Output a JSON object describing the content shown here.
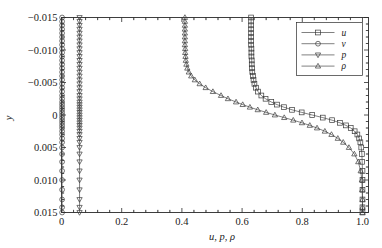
{
  "chart_data": {
    "type": "line",
    "title": "",
    "xlabel": "u, p, ρ",
    "ylabel": "y",
    "xlim": [
      0,
      1.02
    ],
    "ylim": [
      -0.015,
      0.015
    ],
    "y_inverted": true,
    "grid": false,
    "legend_position": "upper-right",
    "xticks": [
      0,
      0.2,
      0.4,
      0.6,
      0.8,
      1.0
    ],
    "xticklabels": [
      "0",
      "0.2",
      "0.4",
      "0.6",
      "0.8",
      "1.0"
    ],
    "yticks": [
      -0.015,
      -0.01,
      -0.005,
      0,
      0.005,
      0.01,
      0.015
    ],
    "yticklabels": [
      "−0.015",
      "−0.010",
      "−0.005",
      "0",
      "0.005",
      "0.010",
      "0.015"
    ],
    "x_minor_tick_count": 4,
    "y_minor_tick_count": 4,
    "series": [
      {
        "name": "u",
        "marker": "square",
        "y": [
          -0.015,
          -0.0144,
          -0.0138,
          -0.0132,
          -0.0126,
          -0.012,
          -0.0114,
          -0.0108,
          -0.0102,
          -0.0096,
          -0.009,
          -0.0084,
          -0.0078,
          -0.0072,
          -0.0066,
          -0.006,
          -0.0054,
          -0.0048,
          -0.0042,
          -0.0036,
          -0.003,
          -0.0025,
          -0.002,
          -0.0016,
          -0.0012,
          -0.0008,
          -0.0004,
          0.0,
          0.0004,
          0.0008,
          0.0012,
          0.0016,
          0.002,
          0.0025,
          0.003,
          0.0036,
          0.0042,
          0.005,
          0.006,
          0.0072,
          0.0086,
          0.01,
          0.0115,
          0.013,
          0.0142,
          0.015
        ],
        "values": [
          0.63,
          0.63,
          0.63,
          0.63,
          0.63,
          0.63,
          0.63,
          0.63,
          0.631,
          0.631,
          0.631,
          0.632,
          0.632,
          0.633,
          0.634,
          0.636,
          0.638,
          0.641,
          0.646,
          0.653,
          0.664,
          0.678,
          0.697,
          0.716,
          0.739,
          0.766,
          0.798,
          0.833,
          0.868,
          0.899,
          0.925,
          0.945,
          0.961,
          0.974,
          0.983,
          0.989,
          0.993,
          0.996,
          0.998,
          0.999,
          1.0,
          1.0,
          1.0,
          1.0,
          1.0,
          1.0
        ]
      },
      {
        "name": "v",
        "marker": "circle",
        "y": [
          -0.015,
          -0.0144,
          -0.0138,
          -0.0132,
          -0.0126,
          -0.012,
          -0.0114,
          -0.0108,
          -0.0102,
          -0.0096,
          -0.009,
          -0.0084,
          -0.0078,
          -0.0072,
          -0.0066,
          -0.006,
          -0.0054,
          -0.0048,
          -0.0042,
          -0.0036,
          -0.003,
          -0.0025,
          -0.002,
          -0.0016,
          -0.0012,
          -0.0008,
          -0.0004,
          0.0,
          0.0004,
          0.0008,
          0.0012,
          0.0016,
          0.002,
          0.0025,
          0.003,
          0.0036,
          0.0042,
          0.005,
          0.006,
          0.0072,
          0.0086,
          0.01,
          0.0115,
          0.013,
          0.0142,
          0.015
        ],
        "values": [
          0.002,
          0.002,
          0.002,
          0.002,
          0.002,
          0.002,
          0.002,
          0.002,
          0.002,
          0.002,
          0.002,
          0.002,
          0.002,
          0.002,
          0.002,
          0.002,
          0.002,
          0.002,
          0.002,
          0.002,
          0.002,
          0.002,
          0.002,
          0.002,
          0.002,
          0.002,
          0.002,
          0.002,
          0.002,
          0.002,
          0.002,
          0.002,
          0.002,
          0.002,
          0.002,
          0.002,
          0.002,
          0.002,
          0.002,
          0.002,
          0.002,
          0.002,
          0.002,
          0.002,
          0.002,
          0.002
        ]
      },
      {
        "name": "p",
        "marker": "triangle-down",
        "y": [
          -0.015,
          -0.0144,
          -0.0138,
          -0.0132,
          -0.0126,
          -0.012,
          -0.0114,
          -0.0108,
          -0.0102,
          -0.0096,
          -0.009,
          -0.0084,
          -0.0078,
          -0.0072,
          -0.0066,
          -0.006,
          -0.0054,
          -0.0048,
          -0.0042,
          -0.0036,
          -0.003,
          -0.0025,
          -0.002,
          -0.0016,
          -0.0012,
          -0.0008,
          -0.0004,
          0.0,
          0.0004,
          0.0008,
          0.0012,
          0.0016,
          0.002,
          0.0025,
          0.003,
          0.0036,
          0.0042,
          0.005,
          0.006,
          0.0072,
          0.0086,
          0.01,
          0.0115,
          0.013,
          0.0142,
          0.015
        ],
        "values": [
          0.06,
          0.06,
          0.06,
          0.06,
          0.06,
          0.06,
          0.06,
          0.06,
          0.06,
          0.06,
          0.06,
          0.06,
          0.06,
          0.06,
          0.06,
          0.06,
          0.06,
          0.06,
          0.06,
          0.06,
          0.06,
          0.06,
          0.06,
          0.06,
          0.06,
          0.06,
          0.06,
          0.06,
          0.06,
          0.06,
          0.06,
          0.06,
          0.06,
          0.06,
          0.06,
          0.06,
          0.06,
          0.06,
          0.06,
          0.06,
          0.06,
          0.06,
          0.06,
          0.06,
          0.06,
          0.06
        ]
      },
      {
        "name": "ρ",
        "marker": "triangle-up",
        "y": [
          -0.015,
          -0.0144,
          -0.0138,
          -0.0132,
          -0.0126,
          -0.012,
          -0.0114,
          -0.0108,
          -0.0102,
          -0.0096,
          -0.009,
          -0.0084,
          -0.0078,
          -0.0072,
          -0.0066,
          -0.006,
          -0.0054,
          -0.0048,
          -0.0042,
          -0.0036,
          -0.003,
          -0.0025,
          -0.002,
          -0.0016,
          -0.0012,
          -0.0008,
          -0.0004,
          0.0,
          0.0004,
          0.0008,
          0.0012,
          0.0016,
          0.002,
          0.0025,
          0.003,
          0.0036,
          0.0042,
          0.005,
          0.006,
          0.0072,
          0.0086,
          0.01,
          0.0115,
          0.013,
          0.0142,
          0.015
        ],
        "values": [
          0.41,
          0.41,
          0.41,
          0.41,
          0.41,
          0.41,
          0.41,
          0.41,
          0.411,
          0.411,
          0.412,
          0.413,
          0.415,
          0.418,
          0.423,
          0.431,
          0.443,
          0.459,
          0.479,
          0.503,
          0.53,
          0.553,
          0.58,
          0.602,
          0.626,
          0.652,
          0.68,
          0.709,
          0.74,
          0.77,
          0.799,
          0.825,
          0.849,
          0.875,
          0.897,
          0.918,
          0.936,
          0.955,
          0.973,
          0.986,
          0.994,
          0.998,
          0.999,
          1.0,
          1.0,
          1.0
        ]
      }
    ]
  },
  "legend": {
    "entries": [
      {
        "label": "u",
        "marker": "square"
      },
      {
        "label": "v",
        "marker": "circle"
      },
      {
        "label": "p",
        "marker": "triangle-down"
      },
      {
        "label": "ρ",
        "marker": "triangle-up"
      }
    ]
  },
  "colors": {
    "axis": "#2b2b2b",
    "series": "#4a4a4a",
    "background": "#ffffff"
  }
}
